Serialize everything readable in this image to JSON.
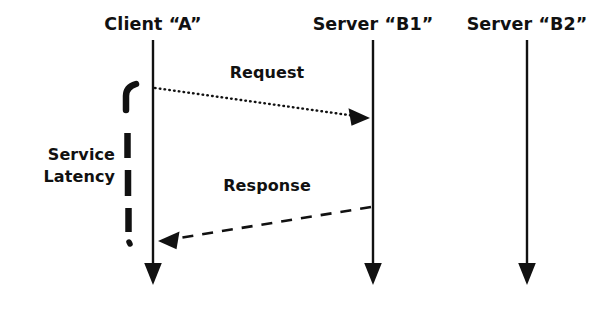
{
  "diagram": {
    "type": "sequence-diagram",
    "background_color": "#ffffff",
    "ink_color": "#111111",
    "participants": [
      {
        "id": "client-a",
        "label": "Client “A”",
        "x": 153,
        "lifeline_top": 40,
        "lifeline_bottom": 286
      },
      {
        "id": "server-b1",
        "label": "Server “B1”",
        "x": 373,
        "lifeline_top": 40,
        "lifeline_bottom": 286
      },
      {
        "id": "server-b2",
        "label": "Server “B2”",
        "x": 527,
        "lifeline_top": 40,
        "lifeline_bottom": 286
      }
    ],
    "messages": [
      {
        "id": "request",
        "label": "Request",
        "from": "client-a",
        "to": "server-b1",
        "direction": "right",
        "line_style": "dotted",
        "start_x": 155,
        "start_y": 88,
        "end_x": 370,
        "end_y": 118,
        "label_x": 267,
        "label_y": 78
      },
      {
        "id": "response",
        "label": "Response",
        "from": "server-b1",
        "to": "client-a",
        "direction": "left",
        "line_style": "dashed",
        "start_x": 371,
        "start_y": 207,
        "end_x": 158,
        "end_y": 241,
        "label_x": 267,
        "label_y": 191
      }
    ],
    "annotations": [
      {
        "id": "service-latency",
        "line1": "Service",
        "line2": "Latency",
        "text_x": 115,
        "line1_y": 160,
        "line2_y": 182,
        "brace_x": 128,
        "brace_top": 85,
        "brace_bottom": 245,
        "brace_style": "dashed"
      }
    ]
  }
}
